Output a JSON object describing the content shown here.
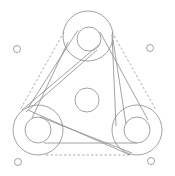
{
  "diagram": {
    "title": "",
    "colors": {
      "background": "#ffffff",
      "line": "#8a8a8a",
      "dashed": "#9a9a9a"
    },
    "components": {
      "pulleys": [
        {
          "id": "top-pulley",
          "label": ""
        },
        {
          "id": "bottom-left-pulley",
          "label": ""
        },
        {
          "id": "bottom-right-pulley",
          "label": ""
        }
      ],
      "center_idler": {
        "id": "center-idler",
        "label": ""
      },
      "mounting_holes": [
        {
          "id": "hole-top-left"
        },
        {
          "id": "hole-top-right"
        },
        {
          "id": "hole-bottom-left"
        },
        {
          "id": "hole-bottom-right"
        }
      ],
      "belts": [
        "belt-top-to-left",
        "belt-top-to-right",
        "belt-left-to-right"
      ],
      "outline": "dashed-triangle-envelope"
    }
  }
}
